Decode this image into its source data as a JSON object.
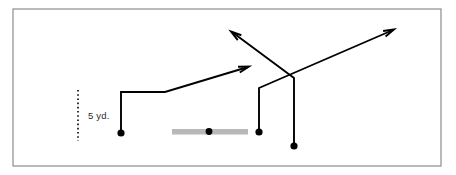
{
  "diagram": {
    "canvas": {
      "width": 456,
      "height": 175
    },
    "colors": {
      "background": "#ffffff",
      "frame_stroke": "#8d8d8d",
      "ink": "#000000",
      "scrimmage_gray": "#b8b8b8",
      "label_text": "#2b2b2b"
    },
    "frame": {
      "x": 13,
      "y": 9,
      "width": 428,
      "height": 157,
      "stroke_width": 1.2
    },
    "measurement": {
      "label": "5 yd.",
      "label_x": 88,
      "label_y": 119,
      "axis_x": 78,
      "top_y": 90,
      "bottom_y": 141,
      "dash_pattern": "1.6 2.6",
      "stroke_width": 1.6
    },
    "line_of_scrimmage": {
      "name": "offensive-line-bar",
      "x": 172,
      "y": 129,
      "width": 76,
      "height": 5.5
    },
    "ball": {
      "cx": 209,
      "cy": 131.5,
      "r": 3.4
    },
    "players": [
      {
        "id": "receiver-left",
        "cx": 121,
        "cy": 133,
        "r": 3.6
      },
      {
        "id": "receiver-slot",
        "cx": 259,
        "cy": 132,
        "r": 3.6
      },
      {
        "id": "receiver-outside",
        "cx": 294,
        "cy": 146,
        "r": 3.6
      }
    ],
    "routes": [
      {
        "id": "route-left-shallow-cross",
        "player": "receiver-left",
        "points": "121,133 121,92 165,92 248,67",
        "stroke_width": 1.9,
        "arrow": {
          "tip_x": 249,
          "tip_y": 66.5,
          "angle_deg": 343
        }
      },
      {
        "id": "route-slot-wheel-out",
        "player": "receiver-slot",
        "points": "259,132 259,88 393,30",
        "stroke_width": 1.9,
        "arrow": {
          "tip_x": 394,
          "tip_y": 29.5,
          "angle_deg": 336
        }
      },
      {
        "id": "route-outside-post-in",
        "player": "receiver-outside",
        "points": "294,146 294,78 232,32",
        "stroke_width": 1.9,
        "arrow": {
          "tip_x": 231,
          "tip_y": 31.5,
          "angle_deg": 216
        }
      }
    ],
    "arrow_head": {
      "length": 11,
      "half_angle_deg": 16,
      "stroke_width": 1.9
    }
  }
}
